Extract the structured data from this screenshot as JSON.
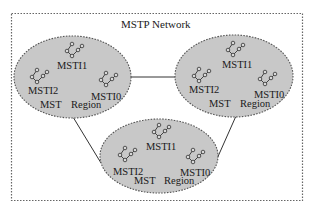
{
  "title": "MSTP Network",
  "colors": {
    "region_fill": "#c8c8c8",
    "region_border": "#555555",
    "frame_border": "#666666",
    "link": "#333333",
    "text": "#1a1a1a"
  },
  "regions": [
    {
      "id": "region-left",
      "instances": [
        "MSTI1",
        "MSTI2",
        "MSTI0"
      ],
      "label_mst": "MST",
      "label_region": "Region"
    },
    {
      "id": "region-right",
      "instances": [
        "MSTI1",
        "MSTI2",
        "MSTI0"
      ],
      "label_mst": "MST",
      "label_region": "Region"
    },
    {
      "id": "region-bottom",
      "instances": [
        "MSTI1",
        "MSTI2",
        "MSTI0"
      ],
      "label_mst": "MST",
      "label_region": "Region"
    }
  ],
  "links": [
    {
      "from": "region-left",
      "to": "region-right"
    },
    {
      "from": "region-left",
      "to": "region-bottom"
    },
    {
      "from": "region-right",
      "to": "region-bottom"
    }
  ],
  "icons": {
    "instance_tree": "spanning-tree-icon"
  }
}
